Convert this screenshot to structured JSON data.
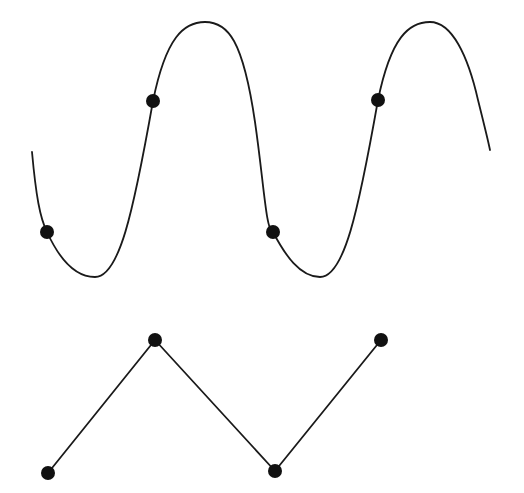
{
  "figure": {
    "title": "",
    "width": 524,
    "height": 493,
    "background_color": "#ffffff",
    "stroke_color": "#1a1a1a",
    "marker_color": "#111111"
  },
  "chart_data": {
    "type": "line",
    "title": "",
    "subtitle": "",
    "xlabel": "",
    "ylabel": "",
    "grid": false,
    "legend": "none",
    "axes_visible": false,
    "tick_labels_x": [],
    "tick_labels_y": [],
    "xlim": [
      0,
      524
    ],
    "ylim": [
      493,
      0
    ],
    "series": [
      {
        "name": "smooth-wave",
        "style": "smooth-curve",
        "color": "#1a1a1a",
        "line_width": 1.8,
        "marker": "circle",
        "marker_size": 14,
        "marker_color": "#111111",
        "path_points": [
          {
            "x": 32,
            "y": 152
          },
          {
            "x": 47,
            "y": 232
          },
          {
            "x": 95,
            "y": 277
          },
          {
            "x": 153,
            "y": 101
          },
          {
            "x": 205,
            "y": 22
          },
          {
            "x": 273,
            "y": 232
          },
          {
            "x": 320,
            "y": 277
          },
          {
            "x": 378,
            "y": 100
          },
          {
            "x": 430,
            "y": 22
          },
          {
            "x": 490,
            "y": 150
          }
        ],
        "marker_points": [
          {
            "x": 47,
            "y": 232
          },
          {
            "x": 153,
            "y": 101
          },
          {
            "x": 273,
            "y": 232
          },
          {
            "x": 378,
            "y": 100
          }
        ],
        "path_d": "M 32 152 C 36 196, 40 218, 47 232 C 58 256, 74 277, 95 277 C 119 277, 133 214, 153 101 C 166 37, 184 22, 205 22 C 228 22, 243 40, 255 122 C 264 184, 266 232, 273 232 C 285 255, 300 277, 320 277 C 344 277, 358 213, 378 100 C 391 37, 409 22, 430 22 C 452 22, 468 56, 478 100 C 484 124, 488 140, 490 150"
      },
      {
        "name": "zigzag",
        "style": "straight-segments",
        "color": "#1a1a1a",
        "line_width": 1.8,
        "marker": "circle",
        "marker_size": 14,
        "marker_color": "#111111",
        "path_points": [
          {
            "x": 48,
            "y": 473
          },
          {
            "x": 155,
            "y": 340
          },
          {
            "x": 275,
            "y": 471
          },
          {
            "x": 381,
            "y": 340
          }
        ],
        "marker_points": [
          {
            "x": 48,
            "y": 473
          },
          {
            "x": 155,
            "y": 340
          },
          {
            "x": 275,
            "y": 471
          },
          {
            "x": 381,
            "y": 340
          }
        ],
        "path_d": "M 48 473 L 155 340 L 275 471 L 381 340"
      }
    ]
  }
}
